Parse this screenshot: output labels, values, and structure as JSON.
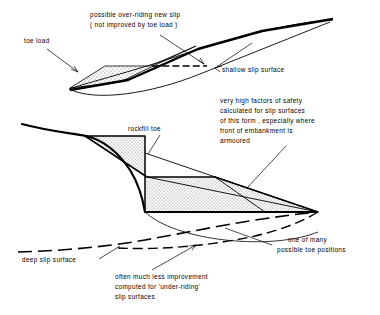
{
  "figure": {
    "ink_color": "#000000",
    "fill_color": "#ffffff",
    "stipple_color": "#7a7a7a"
  },
  "annotations": {
    "overriding_slip": {
      "line1": "possible over-riding new slip",
      "line2": "( not improved by toe load )"
    },
    "toe_load": "toe load",
    "shallow_slip": "shallow slip surface",
    "rockfill_toe": "rockfill toe",
    "high_fos": {
      "line1": "very high factors of safety",
      "line2": "calculated for slip surfaces",
      "line3": "of this form , especially where",
      "line4": "front of embankment is",
      "line5": "armoured"
    },
    "deep_slip": "deep slip surface",
    "toe_positions": {
      "line1": "one of many",
      "line2": "possible toe positions"
    },
    "underriding": {
      "line1": "often much less improvement",
      "line2": "computed for  'under-riding'",
      "line3": "slip surfaces"
    }
  }
}
